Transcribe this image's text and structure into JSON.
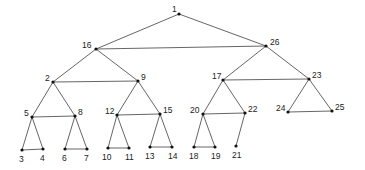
{
  "diagram": {
    "type": "tree",
    "colors": {
      "edge": "#555555",
      "node": "#111111",
      "label": "#222222",
      "background": "#ffffff"
    },
    "nodes": [
      {
        "id": "1",
        "x": 179,
        "y": 14,
        "lx": 172,
        "ly": 12,
        "label": "1"
      },
      {
        "id": "16",
        "x": 96,
        "y": 49,
        "lx": 82,
        "ly": 48,
        "label": "16"
      },
      {
        "id": "26",
        "x": 266,
        "y": 46,
        "lx": 270,
        "ly": 45,
        "label": "26"
      },
      {
        "id": "2",
        "x": 53,
        "y": 82,
        "lx": 45,
        "ly": 81,
        "label": "2"
      },
      {
        "id": "9",
        "x": 138,
        "y": 81,
        "lx": 141,
        "ly": 80,
        "label": "9"
      },
      {
        "id": "17",
        "x": 223,
        "y": 80,
        "lx": 212,
        "ly": 79,
        "label": "17"
      },
      {
        "id": "23",
        "x": 309,
        "y": 79,
        "lx": 312,
        "ly": 78,
        "label": "23"
      },
      {
        "id": "5",
        "x": 32,
        "y": 117,
        "lx": 24,
        "ly": 116,
        "label": "5"
      },
      {
        "id": "8",
        "x": 75,
        "y": 116,
        "lx": 78,
        "ly": 115,
        "label": "8"
      },
      {
        "id": "12",
        "x": 117,
        "y": 115,
        "lx": 105,
        "ly": 114,
        "label": "12"
      },
      {
        "id": "15",
        "x": 160,
        "y": 114,
        "lx": 163,
        "ly": 113,
        "label": "15"
      },
      {
        "id": "20",
        "x": 203,
        "y": 114,
        "lx": 190,
        "ly": 113,
        "label": "20"
      },
      {
        "id": "22",
        "x": 245,
        "y": 113,
        "lx": 248,
        "ly": 112,
        "label": "22"
      },
      {
        "id": "24",
        "x": 288,
        "y": 112,
        "lx": 276,
        "ly": 111,
        "label": "24"
      },
      {
        "id": "25",
        "x": 332,
        "y": 111,
        "lx": 335,
        "ly": 110,
        "label": "25"
      },
      {
        "id": "3",
        "x": 22,
        "y": 150,
        "lx": 19,
        "ly": 162,
        "label": "3"
      },
      {
        "id": "4",
        "x": 43,
        "y": 149,
        "lx": 40,
        "ly": 161,
        "label": "4"
      },
      {
        "id": "6",
        "x": 65,
        "y": 149,
        "lx": 62,
        "ly": 161,
        "label": "6"
      },
      {
        "id": "7",
        "x": 87,
        "y": 149,
        "lx": 84,
        "ly": 161,
        "label": "7"
      },
      {
        "id": "10",
        "x": 108,
        "y": 148,
        "lx": 102,
        "ly": 160,
        "label": "10"
      },
      {
        "id": "11",
        "x": 129,
        "y": 148,
        "lx": 125,
        "ly": 160,
        "label": "11"
      },
      {
        "id": "13",
        "x": 150,
        "y": 147,
        "lx": 145,
        "ly": 159,
        "label": "13"
      },
      {
        "id": "14",
        "x": 172,
        "y": 147,
        "lx": 168,
        "ly": 159,
        "label": "14"
      },
      {
        "id": "18",
        "x": 194,
        "y": 147,
        "lx": 189,
        "ly": 159,
        "label": "18"
      },
      {
        "id": "19",
        "x": 215,
        "y": 147,
        "lx": 211,
        "ly": 159,
        "label": "19"
      },
      {
        "id": "21",
        "x": 236,
        "y": 146,
        "lx": 232,
        "ly": 158,
        "label": "21"
      }
    ],
    "edges": [
      [
        "1",
        "16"
      ],
      [
        "1",
        "26"
      ],
      [
        "16",
        "26"
      ],
      [
        "16",
        "2"
      ],
      [
        "16",
        "9"
      ],
      [
        "2",
        "9"
      ],
      [
        "26",
        "17"
      ],
      [
        "26",
        "23"
      ],
      [
        "17",
        "23"
      ],
      [
        "2",
        "5"
      ],
      [
        "2",
        "8"
      ],
      [
        "5",
        "8"
      ],
      [
        "9",
        "12"
      ],
      [
        "9",
        "15"
      ],
      [
        "12",
        "15"
      ],
      [
        "17",
        "20"
      ],
      [
        "17",
        "22"
      ],
      [
        "20",
        "22"
      ],
      [
        "23",
        "24"
      ],
      [
        "23",
        "25"
      ],
      [
        "24",
        "25"
      ],
      [
        "5",
        "3"
      ],
      [
        "5",
        "4"
      ],
      [
        "3",
        "4"
      ],
      [
        "8",
        "6"
      ],
      [
        "8",
        "7"
      ],
      [
        "6",
        "7"
      ],
      [
        "12",
        "10"
      ],
      [
        "12",
        "11"
      ],
      [
        "10",
        "11"
      ],
      [
        "15",
        "13"
      ],
      [
        "15",
        "14"
      ],
      [
        "13",
        "14"
      ],
      [
        "20",
        "18"
      ],
      [
        "20",
        "19"
      ],
      [
        "18",
        "19"
      ],
      [
        "22",
        "21"
      ]
    ]
  }
}
